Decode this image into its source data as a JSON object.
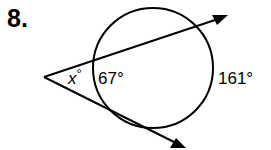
{
  "problem": {
    "number": "8."
  },
  "diagram": {
    "type": "circle-secant-tangent-angle",
    "labels": {
      "x_angle": "x°",
      "x_var": "x",
      "degree": "°",
      "near_arc": "67°",
      "far_arc": "161°"
    },
    "values": {
      "near_arc_measure": 67,
      "far_arc_measure": 161,
      "unknown_angle": "x"
    },
    "colors": {
      "stroke": "#000000",
      "background": "#ffffff"
    }
  }
}
